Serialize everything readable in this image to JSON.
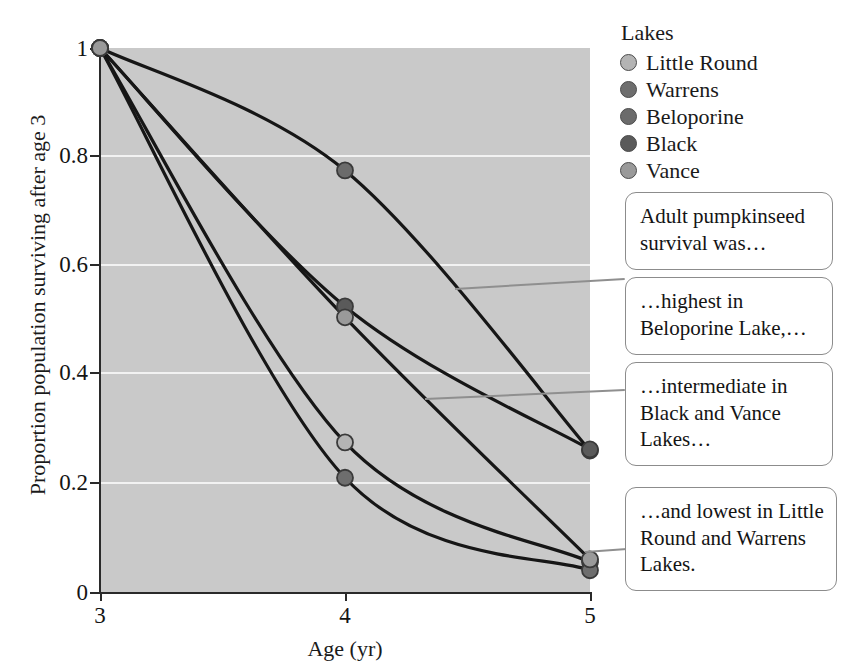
{
  "chart_data": {
    "type": "line",
    "title": "",
    "xlabel": "Age (yr)",
    "ylabel": "Proportion population surviving after age 3",
    "x": [
      3,
      4,
      5
    ],
    "xticks": [
      "3",
      "4",
      "5"
    ],
    "yticks": [
      "0",
      "0.2",
      "0.4",
      "0.6",
      "0.8",
      "1"
    ],
    "xlim": [
      3,
      5
    ],
    "ylim": [
      0,
      1
    ],
    "grid": "horizontal-white",
    "legend_position": "right-top",
    "legend_title": "Lakes",
    "series": [
      {
        "name": "Little Round",
        "color": "#b4b4b4",
        "values": [
          1,
          0.275,
          0.055
        ]
      },
      {
        "name": "Warrens",
        "color": "#6e6e6e",
        "values": [
          1,
          0.21,
          0.04
        ]
      },
      {
        "name": "Beloporine",
        "color": "#6b6b6b",
        "values": [
          1,
          0.775,
          0.26
        ]
      },
      {
        "name": "Black",
        "color": "#5a5a5a",
        "values": [
          1,
          0.525,
          0.262
        ]
      },
      {
        "name": "Vance",
        "color": "#9a9a9a",
        "values": [
          1,
          0.505,
          0.06
        ]
      }
    ]
  },
  "legend": {
    "title": "Lakes",
    "items": [
      {
        "label": "Little Round"
      },
      {
        "label": "Warrens"
      },
      {
        "label": "Beloporine"
      },
      {
        "label": "Black"
      },
      {
        "label": "Vance"
      }
    ]
  },
  "axes": {
    "x_title": "Age (yr)",
    "y_title": "Proportion population surviving after age 3",
    "x_ticks": [
      "3",
      "4",
      "5"
    ],
    "y_ticks": [
      "1",
      "0.8",
      "0.6",
      "0.4",
      "0.2",
      "0"
    ]
  },
  "callouts": [
    {
      "id": "callout-1",
      "line1": "Adult pumpkinseed",
      "line2": "survival was…",
      "line3": ""
    },
    {
      "id": "callout-2",
      "line1": "…highest in",
      "line2": "Beloporine Lake,…",
      "line3": ""
    },
    {
      "id": "callout-3",
      "line1": "…intermediate in",
      "line2": "Black and Vance",
      "line3": "Lakes…"
    },
    {
      "id": "callout-4",
      "line1": "…and lowest in Little",
      "line2": "Round and Warrens",
      "line3": "Lakes."
    }
  ],
  "colors": {
    "plot_background": "#c9c9c9",
    "gridline": "#f2f2f2",
    "curve": "#161616",
    "axis": "#2a2a2a",
    "callout_border": "#8c8c8c",
    "leader_line": "#8f8f8f"
  }
}
